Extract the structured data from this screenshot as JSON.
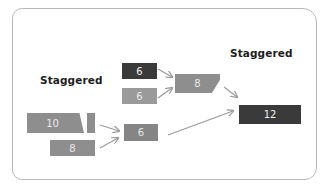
{
  "diagram": {
    "labels": {
      "left": "Staggered",
      "right": "Staggered"
    },
    "blocks": {
      "b10": {
        "value": "10",
        "color": "#8e8e8e"
      },
      "b8_left": {
        "value": "8",
        "color": "#8e8e8e"
      },
      "b6_top": {
        "value": "6",
        "color": "#3a3a3a"
      },
      "b6_mid": {
        "value": "6",
        "color": "#9a9a9a"
      },
      "b8_mid": {
        "value": "8",
        "color": "#8e8e8e"
      },
      "b6_low": {
        "value": "6",
        "color": "#858585"
      },
      "b12": {
        "value": "12",
        "color": "#3a3a3a"
      }
    },
    "colors": {
      "frame": "#b9b9b9",
      "arrow": "#9a9a9a",
      "text_dark": "#1e1e1e",
      "text_light": "#e8e8e8"
    },
    "edges": [
      {
        "from": "10",
        "to": "6 (lower)"
      },
      {
        "from": "8 (left)",
        "to": "6 (lower)"
      },
      {
        "from": "6 (top)",
        "to": "8 (middle)"
      },
      {
        "from": "6 (middle)",
        "to": "8 (middle)"
      },
      {
        "from": "8 (middle)",
        "to": "12"
      },
      {
        "from": "6 (lower)",
        "to": "12"
      }
    ]
  }
}
